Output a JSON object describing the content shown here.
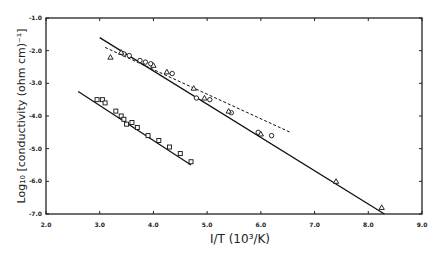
{
  "chart_data": {
    "type": "scatter",
    "title": "",
    "xlabel": "I/T (10³/K)",
    "ylabel": "Log₁₀ [conductivity (ohm cm)⁻¹]",
    "xlim": [
      2.0,
      9.0
    ],
    "ylim": [
      -7.0,
      -1.0
    ],
    "x_ticks": [
      "2.0",
      "3.0",
      "4.0",
      "5.0",
      "6.0",
      "7.0",
      "8.0",
      "9.0"
    ],
    "y_ticks": [
      "-1.0",
      "-2.0",
      "-3.0",
      "-4.0",
      "-5.0",
      "-6.0",
      "-7.0"
    ],
    "grid": false,
    "legend": null,
    "series": [
      {
        "name": "upper-circles",
        "marker": "circle",
        "points": [
          [
            3.45,
            -2.1
          ],
          [
            3.55,
            -2.15
          ],
          [
            3.75,
            -2.3
          ],
          [
            3.85,
            -2.35
          ],
          [
            3.95,
            -2.4
          ],
          [
            4.35,
            -2.7
          ],
          [
            4.8,
            -3.45
          ],
          [
            5.05,
            -3.5
          ],
          [
            5.45,
            -3.9
          ],
          [
            5.95,
            -4.5
          ],
          [
            6.2,
            -4.6
          ]
        ]
      },
      {
        "name": "upper-triangles",
        "marker": "triangle",
        "points": [
          [
            3.2,
            -2.2
          ],
          [
            3.4,
            -2.05
          ],
          [
            4.0,
            -2.45
          ],
          [
            4.25,
            -2.65
          ],
          [
            4.75,
            -3.15
          ],
          [
            4.95,
            -3.45
          ],
          [
            5.4,
            -3.85
          ],
          [
            6.0,
            -4.55
          ],
          [
            7.4,
            -6.0
          ],
          [
            8.25,
            -6.8
          ]
        ]
      },
      {
        "name": "lower-squares",
        "marker": "square",
        "points": [
          [
            2.95,
            -3.5
          ],
          [
            3.05,
            -3.5
          ],
          [
            3.1,
            -3.6
          ],
          [
            3.3,
            -3.85
          ],
          [
            3.4,
            -4.0
          ],
          [
            3.45,
            -4.1
          ],
          [
            3.5,
            -4.25
          ],
          [
            3.6,
            -4.2
          ],
          [
            3.7,
            -4.35
          ],
          [
            3.9,
            -4.6
          ],
          [
            4.1,
            -4.75
          ],
          [
            4.3,
            -4.95
          ],
          [
            4.5,
            -5.15
          ],
          [
            4.7,
            -5.4
          ]
        ]
      },
      {
        "name": "upper-fit-solid",
        "style": "line",
        "points": [
          [
            3.0,
            -1.6
          ],
          [
            8.3,
            -7.0
          ]
        ]
      },
      {
        "name": "upper-fit-dashed",
        "style": "dashed",
        "points": [
          [
            3.1,
            -1.9
          ],
          [
            6.55,
            -4.5
          ]
        ]
      },
      {
        "name": "lower-fit-solid",
        "style": "line",
        "points": [
          [
            2.6,
            -3.25
          ],
          [
            4.7,
            -5.5
          ]
        ]
      }
    ]
  }
}
